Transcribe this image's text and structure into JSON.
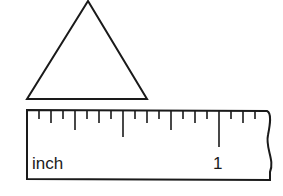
{
  "diagram": {
    "shape": {
      "type": "triangle",
      "points": [
        [
          88,
          1
        ],
        [
          27,
          99
        ],
        [
          147,
          99
        ]
      ],
      "stroke": "#1a1a1a"
    },
    "ruler": {
      "unit_label": "inch",
      "mark_label": "1",
      "divisions_per_inch": 16,
      "zero_x": 27,
      "px_per_sixteenth": 12,
      "stroke": "#1a1a1a"
    }
  }
}
